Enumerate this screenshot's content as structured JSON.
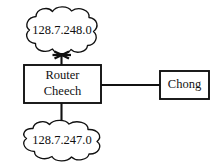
{
  "diagram": {
    "background_color": "#ffffff",
    "stroke_color": "#111111",
    "nodes": {
      "top_network": {
        "type": "cloud",
        "label": "128.7.248.0",
        "icon": "cloud-icon"
      },
      "router": {
        "type": "box",
        "label_line_1": "Router",
        "label_line_2": "Cheech",
        "icon": "router-box-icon"
      },
      "bottom_network": {
        "type": "cloud",
        "label": "128.7.247.0",
        "icon": "cloud-icon"
      },
      "host": {
        "type": "box",
        "label": "Chong",
        "icon": "host-box-icon"
      }
    },
    "links": [
      {
        "name": "router-to-top-network",
        "from": "router",
        "to": "top_network",
        "orientation": "vertical",
        "status": "failed",
        "marker": "x-cross-mark"
      },
      {
        "name": "router-to-bottom-network",
        "from": "router",
        "to": "bottom_network",
        "orientation": "vertical",
        "status": "up",
        "marker": "none"
      },
      {
        "name": "router-to-host-chong",
        "from": "router",
        "to": "host",
        "orientation": "horizontal",
        "status": "up",
        "marker": "none"
      }
    ]
  }
}
